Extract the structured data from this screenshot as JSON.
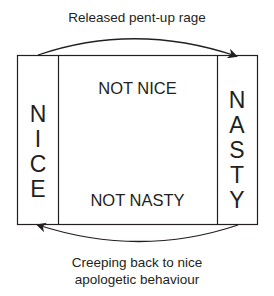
{
  "diagram": {
    "top_arrow_label": "Released pent-up rage",
    "bottom_arrow_label_line1": "Creeping back to nice",
    "bottom_arrow_label_line2": "apologetic behaviour",
    "left_column": {
      "label": "NICE",
      "letters": [
        "N",
        "I",
        "C",
        "E"
      ]
    },
    "right_column": {
      "label": "NASTY",
      "letters": [
        "N",
        "A",
        "S",
        "T",
        "Y"
      ]
    },
    "center_top_label": "NOT NICE",
    "center_bottom_label": "NOT NASTY",
    "colors": {
      "line": "#231f20",
      "background": "#ffffff"
    }
  }
}
